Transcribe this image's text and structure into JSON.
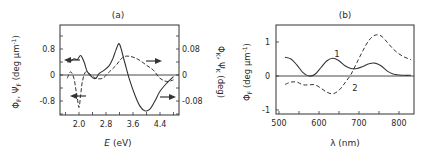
{
  "figure": {
    "panel_a_label": "(a)",
    "panel_b_label": "(b)"
  },
  "chart_data": [
    {
      "type": "line",
      "title": "(a)",
      "xlabel": "E (eV)",
      "ylabel_left": "Φ_F, Ψ_F (deg μm⁻¹)",
      "ylabel_right": "Φ_K, Ψ_K (deg)",
      "xlim": [
        1.5,
        4.9
      ],
      "ylim_left": [
        -1.2,
        1.2
      ],
      "ylim_right": [
        -0.12,
        0.12
      ],
      "x_ticks": [
        2.0,
        2.8,
        3.6,
        4.4
      ],
      "x_tick_labels": [
        "2.0",
        "2.8",
        "3.6",
        "4.4"
      ],
      "y_ticks_left": [
        -0.8,
        0,
        0.8
      ],
      "y_tick_labels_left": [
        "-0.8",
        "0",
        "0.8"
      ],
      "y_ticks_right": [
        -0.08,
        0,
        0.08
      ],
      "y_tick_labels_right": [
        "-0.08",
        "0",
        "0.08"
      ],
      "grid": false,
      "annotations": [
        {
          "text": "← (arrow to left axis)",
          "x": 1.65,
          "y": 0.45
        },
        {
          "text": "← (arrow to left axis)",
          "x": 1.75,
          "y": -0.65
        },
        {
          "text": "→ (arrow to right axis)",
          "x": 4.2,
          "y": 0.4
        },
        {
          "text": "→ (arrow to right axis)",
          "x": 4.55,
          "y": -0.7
        }
      ],
      "series": [
        {
          "name": "Faraday (solid)",
          "style": "solid",
          "axis": "left",
          "x": [
            1.65,
            1.75,
            1.85,
            1.95,
            2.05,
            2.15,
            2.25,
            2.4,
            2.5,
            2.6,
            2.75,
            2.9,
            3.0,
            3.1,
            3.2,
            3.35,
            3.5,
            3.65,
            3.8,
            3.95,
            4.1,
            4.25,
            4.4,
            4.6,
            4.8
          ],
          "y": [
            0.4,
            0.42,
            0.5,
            0.48,
            0.6,
            0.4,
            0.1,
            -0.08,
            -0.1,
            0.05,
            0.15,
            0.3,
            0.5,
            0.78,
            0.95,
            0.4,
            -0.15,
            -0.6,
            -0.95,
            -1.1,
            -1.05,
            -0.8,
            -0.5,
            -0.25,
            -0.05
          ]
        },
        {
          "name": "Faraday/Kerr (dashed)",
          "style": "dashed",
          "axis": "right",
          "x": [
            1.65,
            1.75,
            1.85,
            1.9,
            1.95,
            2.0,
            2.05,
            2.1,
            2.2,
            2.35,
            2.5,
            2.7,
            2.9,
            3.1,
            3.25,
            3.4,
            3.6,
            3.8,
            4.0,
            4.2,
            4.4,
            4.6,
            4.8
          ],
          "y": [
            -0.01,
            0.01,
            -0.01,
            -0.04,
            -0.07,
            -0.1,
            -0.06,
            -0.02,
            0.01,
            0.0,
            -0.01,
            -0.01,
            0.01,
            0.03,
            0.05,
            0.058,
            0.055,
            0.045,
            0.03,
            0.015,
            -0.01,
            -0.02,
            -0.015
          ]
        }
      ]
    },
    {
      "type": "line",
      "title": "(b)",
      "xlabel": "λ (nm)",
      "ylabel": "Φ_F (deg μm⁻¹)",
      "xlim": [
        490,
        840
      ],
      "ylim": [
        -1.1,
        1.5
      ],
      "x_ticks": [
        500,
        600,
        700,
        800
      ],
      "x_tick_labels": [
        "500",
        "600",
        "700",
        "800"
      ],
      "y_ticks": [
        -1,
        0,
        1
      ],
      "y_tick_labels": [
        "-1",
        "0",
        "1"
      ],
      "grid": false,
      "annotations": [
        {
          "text": "1",
          "x": 645,
          "y": 0.65
        },
        {
          "text": "2",
          "x": 690,
          "y": -0.35
        }
      ],
      "series": [
        {
          "name": "1",
          "style": "solid",
          "x": [
            515,
            530,
            545,
            560,
            575,
            590,
            605,
            620,
            635,
            650,
            665,
            680,
            695,
            710,
            725,
            740,
            755,
            770,
            785,
            800,
            815,
            830
          ],
          "y": [
            0.55,
            0.5,
            0.32,
            0.1,
            0.0,
            0.05,
            0.25,
            0.45,
            0.52,
            0.45,
            0.3,
            0.22,
            0.22,
            0.28,
            0.36,
            0.38,
            0.3,
            0.15,
            0.06,
            0.03,
            0.02,
            0.02
          ]
        },
        {
          "name": "2",
          "style": "dashed",
          "x": [
            515,
            530,
            545,
            560,
            575,
            590,
            605,
            620,
            635,
            650,
            665,
            680,
            695,
            710,
            725,
            740,
            755,
            770,
            785,
            800,
            815,
            830
          ],
          "y": [
            -0.25,
            -0.18,
            -0.18,
            -0.26,
            -0.26,
            -0.26,
            -0.36,
            -0.48,
            -0.52,
            -0.42,
            -0.2,
            0.05,
            0.4,
            0.75,
            1.05,
            1.2,
            1.18,
            1.0,
            0.8,
            0.65,
            0.55,
            0.48
          ]
        }
      ]
    }
  ]
}
